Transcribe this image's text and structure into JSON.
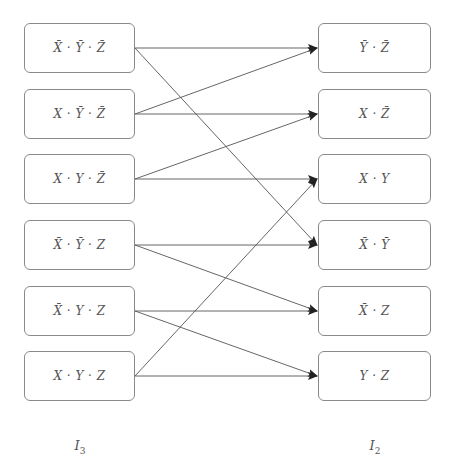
{
  "diagram": {
    "colors": {
      "edge": "#555555",
      "border": "#8a8a8a",
      "text": "#555555"
    },
    "left_column": {
      "label": "I",
      "label_sub": "3",
      "nodes": [
        {
          "id": "L1",
          "text": "X̄ · Ȳ · Z̄"
        },
        {
          "id": "L2",
          "text": "X · Ȳ · Z̄"
        },
        {
          "id": "L3",
          "text": "X · Y · Z̄"
        },
        {
          "id": "L4",
          "text": "X̄ · Ȳ · Z"
        },
        {
          "id": "L5",
          "text": "X̄ · Y · Z"
        },
        {
          "id": "L6",
          "text": "X · Y · Z"
        }
      ]
    },
    "right_column": {
      "label": "I",
      "label_sub": "2",
      "nodes": [
        {
          "id": "R1",
          "text": "Ȳ · Z̄"
        },
        {
          "id": "R2",
          "text": "X · Z̄"
        },
        {
          "id": "R3",
          "text": "X · Y"
        },
        {
          "id": "R4",
          "text": "X̄ · Ȳ"
        },
        {
          "id": "R5",
          "text": "X̄ · Z"
        },
        {
          "id": "R6",
          "text": "Y · Z"
        }
      ]
    },
    "edges": [
      {
        "from": "L1",
        "to": "R1"
      },
      {
        "from": "L1",
        "to": "R4"
      },
      {
        "from": "L2",
        "to": "R1"
      },
      {
        "from": "L2",
        "to": "R2"
      },
      {
        "from": "L3",
        "to": "R2"
      },
      {
        "from": "L3",
        "to": "R3"
      },
      {
        "from": "L4",
        "to": "R4"
      },
      {
        "from": "L4",
        "to": "R5"
      },
      {
        "from": "L5",
        "to": "R5"
      },
      {
        "from": "L5",
        "to": "R6"
      },
      {
        "from": "L6",
        "to": "R3"
      },
      {
        "from": "L6",
        "to": "R6"
      }
    ]
  }
}
